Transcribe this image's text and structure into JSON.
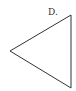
{
  "diagram": {
    "option_label": "D.",
    "shape": "triangle",
    "stroke_color": "#333333",
    "vertices": [
      [
        71,
        15
      ],
      [
        10,
        51
      ],
      [
        71,
        88
      ]
    ]
  }
}
